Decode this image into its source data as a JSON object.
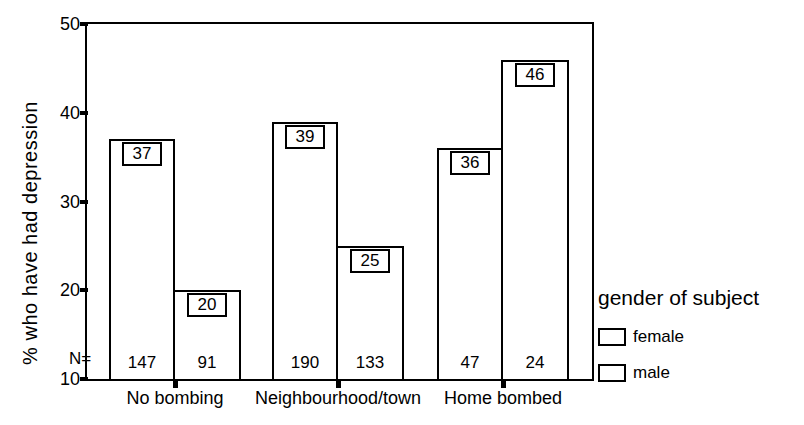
{
  "figure": {
    "background_color": "#ffffff",
    "ink_color": "#000000"
  },
  "chart_data": {
    "type": "bar",
    "title": "",
    "xlabel": "",
    "ylabel": "% who have had depression",
    "ylim": [
      10,
      50
    ],
    "yticks": [
      "10",
      "20",
      "30",
      "40",
      "50"
    ],
    "grid": false,
    "bar_fill": "#ffffff",
    "bar_labels_boxed": true,
    "n_prefix": "N=",
    "categories": [
      "No bombing",
      "Neighbourhood/town",
      "Home bombed"
    ],
    "series": [
      {
        "name": "female",
        "values": [
          37,
          39,
          36
        ],
        "n": [
          147,
          190,
          47
        ]
      },
      {
        "name": "male",
        "values": [
          20,
          25,
          46
        ],
        "n": [
          91,
          133,
          24
        ]
      }
    ],
    "legend": {
      "title": "gender of subject",
      "position": "right",
      "entries": [
        "female",
        "male"
      ]
    }
  }
}
